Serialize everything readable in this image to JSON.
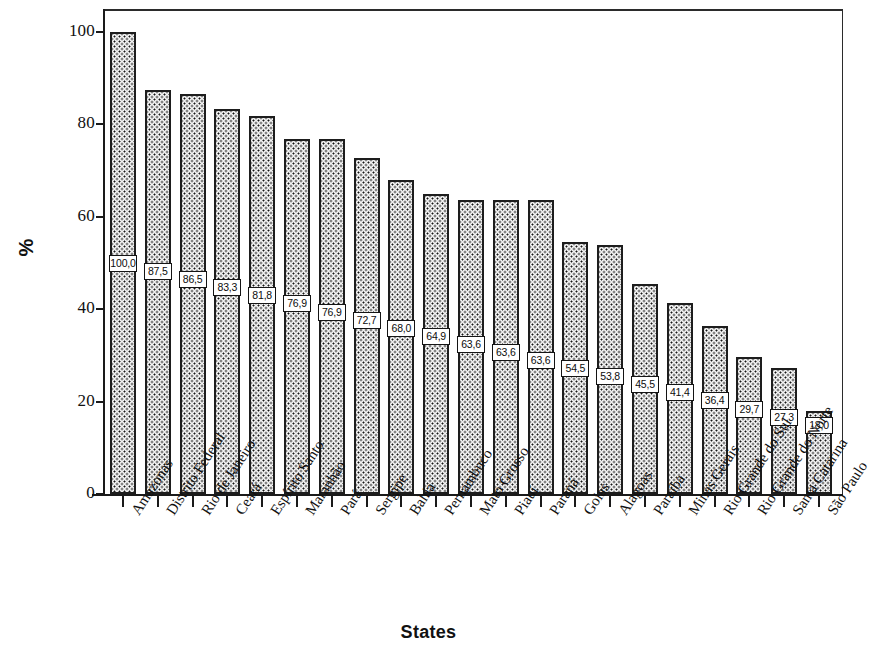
{
  "chart_data": {
    "type": "bar",
    "title": "",
    "xlabel": "States",
    "ylabel": "%",
    "ylim": [
      0,
      105
    ],
    "ytick_labels": [
      "0",
      "20",
      "40",
      "60",
      "80",
      "100"
    ],
    "ytick_values": [
      0,
      20,
      40,
      60,
      80,
      100
    ],
    "grid": false,
    "legend": null,
    "categories": [
      "Amazonas",
      "Distrito Federal",
      "Rio de Janeiro",
      "Ceará",
      "Espírito Santo",
      "Maranhão",
      "Pará",
      "Sergipe",
      "Bahia",
      "Pernambuco",
      "Mato Grosso",
      "Piauí",
      "Paraná",
      "Goias",
      "Alagoas",
      "Paraíba",
      "Minas Gerais",
      "Rio Grande do Sul",
      "Rio Grande do Norte",
      "Santa Catarina",
      "São Paulo"
    ],
    "values": [
      100.0,
      87.5,
      86.5,
      83.3,
      81.8,
      76.9,
      76.9,
      72.7,
      68.0,
      64.9,
      63.6,
      63.6,
      63.6,
      54.5,
      53.8,
      45.5,
      41.4,
      36.4,
      29.7,
      27.3,
      18.0
    ],
    "data_labels": [
      "100,0",
      "87,5",
      "86,5",
      "83,3",
      "81,8",
      "76,9",
      "76,9",
      "72,7",
      "68,0",
      "64,9",
      "63,6",
      "63,6",
      "63,6",
      "54,5",
      "53,8",
      "45,5",
      "41,4",
      "36,4",
      "29,7",
      "27,3",
      "18,0"
    ],
    "bar_fill": "#f2f2f2",
    "bar_edge": "#1d1d1d",
    "label_box_fill": "#ffffff",
    "label_box_edge": "#141414"
  }
}
